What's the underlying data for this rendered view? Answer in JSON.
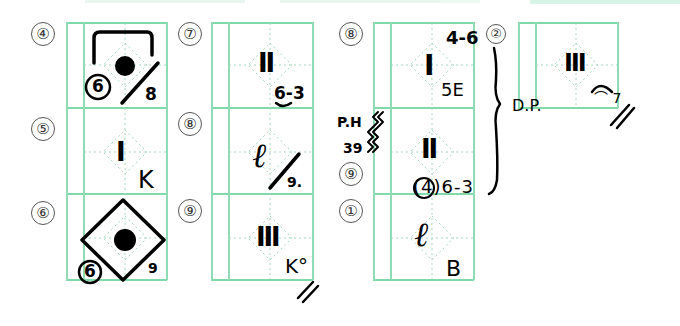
{
  "colors": {
    "grid_solid": "#7fd9a8",
    "grid_dotted": "#a8d8c0",
    "ink": "#000000"
  },
  "columns": [
    {
      "rows": [
        {
          "label": "④",
          "notation": {
            "symbol": "●",
            "circled": "6",
            "suffix": "8",
            "mark": "diamond-slash-bracket"
          }
        },
        {
          "label": "⑤",
          "notation": {
            "symbol": "I",
            "suffix": "K"
          }
        },
        {
          "label": "⑥",
          "notation": {
            "symbol": "●",
            "circled": "6",
            "suffix": "9",
            "mark": "diamond-outline"
          }
        }
      ]
    },
    {
      "rows": [
        {
          "label": "⑦",
          "notation": {
            "symbol": "Ⅱ",
            "suffix": "6-3"
          }
        },
        {
          "label": "⑧",
          "notation": {
            "symbol": "ℓ",
            "suffix": "9."
          }
        },
        {
          "label": "⑨",
          "notation": {
            "symbol": "Ⅲ",
            "suffix": "K°",
            "mark": "//"
          }
        }
      ]
    },
    {
      "rows": [
        {
          "label": "⑧",
          "notation": {
            "symbol": "I",
            "top_suffix": "4-6",
            "suffix": "5E"
          }
        },
        {
          "label": "⑨",
          "notation": {
            "symbol": "Ⅱ",
            "suffix": "(4)6-3",
            "side_note": "P.H",
            "side_note_2": "39"
          }
        },
        {
          "label": "①",
          "notation": {
            "symbol": "ℓ",
            "suffix": "B"
          }
        }
      ]
    },
    {
      "rows": [
        {
          "label": "②",
          "notation": {
            "symbol": "Ⅲ",
            "suffix": "⌒ 7",
            "mark": "//"
          }
        }
      ]
    }
  ],
  "annotations": {
    "brace_label": "D.P.",
    "circled_two": "②"
  }
}
